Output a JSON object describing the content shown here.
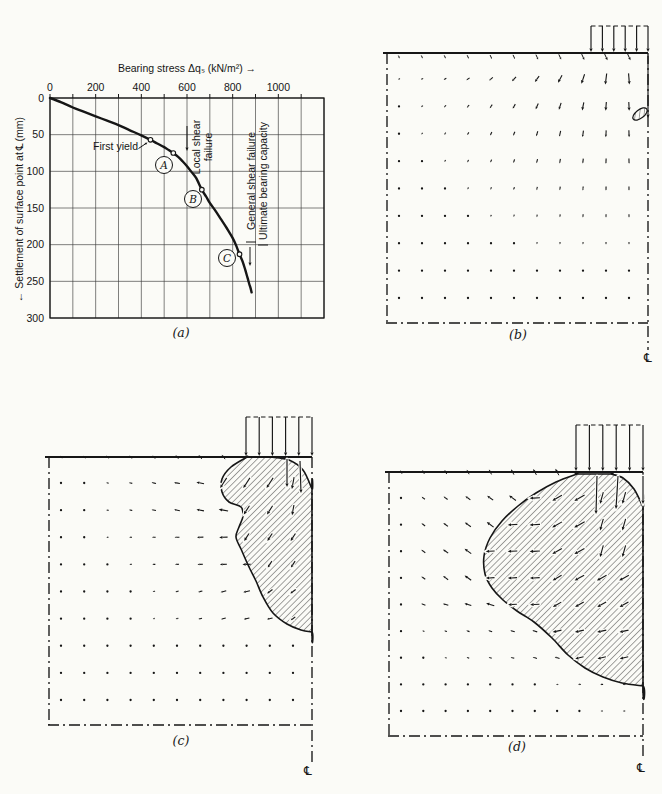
{
  "figure": {
    "background": "#fbfbf7",
    "ink": "#161616"
  },
  "chart_data": {
    "type": "line",
    "panel_label": "(a)",
    "xlabel": "Bearing stress Δqₛ (kN/m²) →",
    "ylabel_prefix": "← Settlement of surface point at",
    "centerline_symbol": "℄",
    "ylabel_suffix": "(mm)",
    "xlim": [
      0,
      1200
    ],
    "ylim": [
      0,
      300
    ],
    "y_inverted": true,
    "x_ticks": [
      0,
      200,
      400,
      600,
      800,
      1000
    ],
    "x_grid_step": 100,
    "y_ticks": [
      0,
      50,
      100,
      150,
      200,
      250,
      300
    ],
    "curve": [
      [
        0,
        0
      ],
      [
        50,
        6
      ],
      [
        100,
        13
      ],
      [
        150,
        19
      ],
      [
        200,
        25
      ],
      [
        250,
        31
      ],
      [
        300,
        37
      ],
      [
        350,
        44
      ],
      [
        400,
        51
      ],
      [
        440,
        57
      ],
      [
        470,
        62
      ],
      [
        500,
        67
      ],
      [
        520,
        71
      ],
      [
        540,
        75
      ],
      [
        560,
        80
      ],
      [
        580,
        86
      ],
      [
        600,
        93
      ],
      [
        620,
        101
      ],
      [
        640,
        109
      ],
      [
        665,
        125
      ],
      [
        685,
        135
      ],
      [
        700,
        143
      ],
      [
        725,
        154
      ],
      [
        750,
        166
      ],
      [
        775,
        178
      ],
      [
        800,
        191
      ],
      [
        815,
        201
      ],
      [
        830,
        213
      ],
      [
        845,
        224
      ],
      [
        855,
        234
      ],
      [
        865,
        245
      ],
      [
        872,
        253
      ],
      [
        878,
        259
      ],
      [
        883,
        265
      ]
    ],
    "markers": [
      {
        "x": 440,
        "y": 57,
        "label": ""
      },
      {
        "x": 540,
        "y": 75,
        "label": "A"
      },
      {
        "x": 665,
        "y": 125,
        "label": "B"
      },
      {
        "x": 830,
        "y": 213,
        "label": "C"
      }
    ],
    "annotations": {
      "first_yield": "First yield",
      "local_shear": [
        "Local shear",
        "failure"
      ],
      "general_shear": [
        "General shear failure",
        "Ultimate bearing capacity"
      ]
    }
  },
  "panels": {
    "b": {
      "label": "(b)",
      "centerline_symbol": "℄",
      "load_arrow_count": 6
    },
    "c": {
      "label": "(c)",
      "centerline_symbol": "℄",
      "load_arrow_count": 6
    },
    "d": {
      "label": "(d)",
      "centerline_symbol": "℄",
      "load_arrow_count": 6
    }
  }
}
